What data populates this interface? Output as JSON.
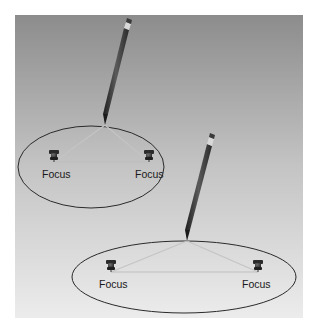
{
  "diagram": {
    "background": {
      "top_color": "#8c8c8c",
      "bottom_color": "#ececec"
    },
    "ellipses": [
      {
        "id": "ellipse-1",
        "foci_labels": [
          "Focus",
          "Focus"
        ],
        "center": [
          91,
          167
        ],
        "rx": 73,
        "ry": 41,
        "foci": [
          [
            54,
            162
          ],
          [
            149,
            162
          ]
        ],
        "pencil_tip": [
          105,
          125
        ],
        "pencil_eraser": [
          127,
          23
        ]
      },
      {
        "id": "ellipse-2",
        "foci_labels": [
          "Focus",
          "Focus"
        ],
        "center": [
          184,
          277
        ],
        "rx": 112,
        "ry": 36,
        "foci": [
          [
            111,
            272
          ],
          [
            258,
            272
          ]
        ],
        "pencil_tip": [
          187,
          241
        ],
        "pencil_eraser": [
          210,
          138
        ]
      }
    ],
    "colors": {
      "ellipse_stroke": "#2a2a2a",
      "string": "#bdbdbd",
      "pencil_body": "#3a3a3a",
      "tack": "#2e2e2e"
    }
  }
}
